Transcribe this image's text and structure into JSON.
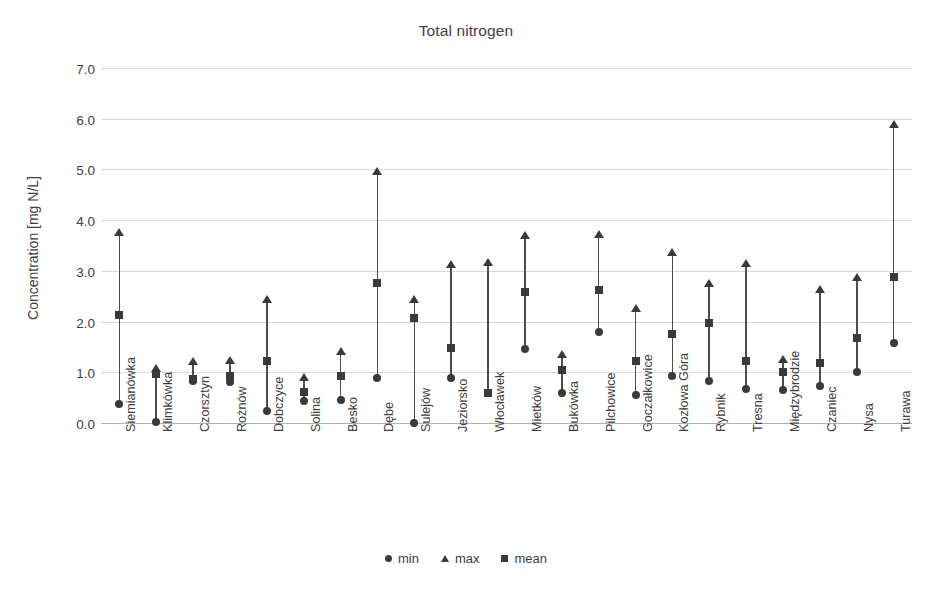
{
  "chart_data": {
    "type": "scatter",
    "title": "Total nitrogen",
    "xlabel": "",
    "ylabel": "Concentration [mg N/L]",
    "ylim": [
      0.0,
      7.0
    ],
    "ytick_labels": [
      "0.0",
      "1.0",
      "2.0",
      "3.0",
      "4.0",
      "5.0",
      "6.0",
      "7.0"
    ],
    "ytick_values": [
      0.0,
      1.0,
      2.0,
      3.0,
      4.0,
      5.0,
      6.0,
      7.0
    ],
    "grid": true,
    "legend_position": "bottom",
    "marker_color": "#3a3a3a",
    "line_color": "#4d4d4d",
    "grid_color": "#d9d9d9",
    "categories": [
      "Siemianówka",
      "Klimkówka",
      "Czorsztyn",
      "Rożnów",
      "Dobczyce",
      "Solina",
      "Besko",
      "Dębe",
      "Sulejów",
      "Jeziorsko",
      "Włocławek",
      "Mietków",
      "Bukówka",
      "Pilchowice",
      "Goczałkowice",
      "Kozłowa Góra",
      "Rybnik",
      "Tresna",
      "Międzybrodzie",
      "Czaniec",
      "Nysa",
      "Turawa"
    ],
    "series": [
      {
        "name": "min",
        "marker": "circle",
        "values": [
          0.39,
          0.03,
          0.84,
          0.82,
          0.26,
          0.46,
          0.47,
          0.91,
          0.02,
          0.9,
          0.61,
          1.48,
          0.62,
          1.82,
          0.57,
          0.95,
          0.85,
          0.69,
          0.68,
          0.75,
          1.03,
          1.6
        ]
      },
      {
        "name": "max",
        "marker": "triangle",
        "values": [
          3.73,
          1.05,
          1.18,
          1.21,
          2.41,
          0.86,
          1.38,
          4.93,
          2.4,
          3.09,
          3.14,
          3.66,
          1.33,
          3.69,
          2.22,
          3.33,
          2.72,
          3.12,
          1.22,
          2.6,
          2.84,
          5.85
        ]
      },
      {
        "name": "mean",
        "marker": "square",
        "values": [
          2.14,
          0.98,
          0.88,
          0.95,
          1.24,
          0.63,
          0.95,
          2.78,
          2.1,
          1.5,
          0.61,
          2.61,
          1.06,
          2.64,
          1.25,
          1.77,
          1.99,
          1.24,
          1.02,
          1.21,
          1.69,
          2.89
        ]
      }
    ]
  },
  "legend": {
    "items": [
      {
        "label": "min",
        "marker": "circle"
      },
      {
        "label": "max",
        "marker": "triangle"
      },
      {
        "label": "mean",
        "marker": "square"
      }
    ]
  },
  "caption_fragment": ""
}
